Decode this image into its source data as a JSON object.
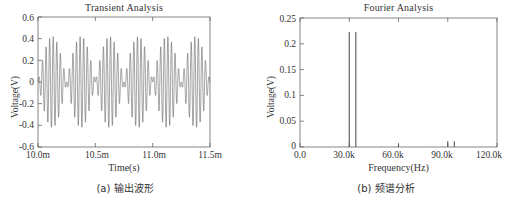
{
  "figure": {
    "background": "#ffffff",
    "line_color": "#555555",
    "axis_color": "#666666",
    "text_color": "#333333"
  },
  "panels": [
    {
      "id": "transient",
      "title": "Transient Analysis",
      "caption": "(a) 输出波形",
      "ylabel": "Voltage(V)",
      "xlabel": "Time(s)",
      "yticks": [
        "0.6",
        "0.4",
        "0.2",
        "0",
        "-0.2",
        "-0.4",
        "-0.6"
      ],
      "xticks": [
        "10.0m",
        "10.5m",
        "11.0m",
        "11.5m"
      ]
    },
    {
      "id": "fourier",
      "title": "Fourier Analysis",
      "caption": "(b) 频谱分析",
      "ylabel": "Voltage(V)",
      "xlabel": "Frequency(Hz)",
      "yticks": [
        "0.25",
        "0.2",
        "0.15",
        "0.1",
        "0.05",
        "0"
      ],
      "xticks": [
        "0.0",
        "30.0k",
        "60.0k",
        "90.0k",
        "120.0k"
      ]
    }
  ],
  "chart_data": [
    {
      "type": "line",
      "id": "transient",
      "title": "Transient Analysis",
      "xlabel": "Time(s)",
      "ylabel": "Voltage(V)",
      "xlim": [
        0.01,
        0.0115
      ],
      "ylim": [
        -0.6,
        0.6
      ],
      "xtick_values": [
        0.01,
        0.0105,
        0.011,
        0.0115
      ],
      "xtick_labels": [
        "10.0m",
        "10.5m",
        "11.0m",
        "11.5m"
      ],
      "ytick_values": [
        0.6,
        0.4,
        0.2,
        0,
        -0.2,
        -0.4,
        -0.6
      ],
      "ytick_labels": [
        "0.6",
        "0.4",
        "0.2",
        "0",
        "-0.2",
        "-0.4",
        "-0.6"
      ],
      "grid": false,
      "legend": null,
      "description": "Double-sideband suppressed-carrier AM waveform: 32 kHz carrier amplitude-modulated by a 2 kHz tone, envelope peaking near 0.42 V with nulls (envelope crossings) at about 10.25 ms, 10.75 ms and 11.25 ms between the three lobes.",
      "signal_model": {
        "carrier_freq_hz": 32000,
        "modulation_freq_hz": 2000,
        "peak_amplitude_v": 0.42,
        "lobes": 3
      }
    },
    {
      "type": "bar",
      "id": "fourier",
      "title": "Fourier Analysis",
      "xlabel": "Frequency(Hz)",
      "ylabel": "Voltage(V)",
      "xlim": [
        0,
        120000
      ],
      "ylim": [
        0,
        0.25
      ],
      "xtick_values": [
        0,
        30000,
        60000,
        90000,
        120000
      ],
      "xtick_labels": [
        "0.0",
        "30.0k",
        "60.0k",
        "90.0k",
        "120.0k"
      ],
      "ytick_values": [
        0.25,
        0.2,
        0.15,
        0.1,
        0.05,
        0
      ],
      "ytick_labels": [
        "0.25",
        "0.2",
        "0.15",
        "0.1",
        "0.05",
        "0"
      ],
      "grid": false,
      "legend": null,
      "x": [
        30000,
        34000,
        60000,
        90000,
        94000
      ],
      "values": [
        0.223,
        0.223,
        0.006,
        0.011,
        0.011
      ],
      "description": "Spectrum of the DSB-SC output: a pair of dominant sidebands at about 30 kHz and 34 kHz reaching 0.223 V, a tiny residual near 60 kHz, and a small third-order sideband pair near 90-94 kHz below 0.015 V."
    }
  ]
}
